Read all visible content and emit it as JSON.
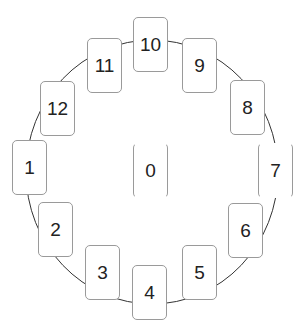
{
  "diagram": {
    "type": "circular-card-arrangement",
    "center_card": "0",
    "ring_cards": [
      {
        "label": "10",
        "x": 133,
        "y": 17
      },
      {
        "label": "11",
        "x": 87,
        "y": 38
      },
      {
        "label": "9",
        "x": 182,
        "y": 38
      },
      {
        "label": "12",
        "x": 40,
        "y": 81
      },
      {
        "label": "8",
        "x": 230,
        "y": 80
      },
      {
        "label": "1",
        "x": 12,
        "y": 140
      },
      {
        "label": "7",
        "x": 258,
        "y": 143
      },
      {
        "label": "2",
        "x": 38,
        "y": 202
      },
      {
        "label": "6",
        "x": 228,
        "y": 203
      },
      {
        "label": "3",
        "x": 85,
        "y": 245
      },
      {
        "label": "5",
        "x": 182,
        "y": 245
      },
      {
        "label": "4",
        "x": 132,
        "y": 265
      }
    ],
    "center": {
      "label": "0",
      "x": 133,
      "y": 143
    },
    "colors": {
      "card_border": "#9a9a9a",
      "ring_line": "#333333",
      "text": "#222222"
    }
  }
}
